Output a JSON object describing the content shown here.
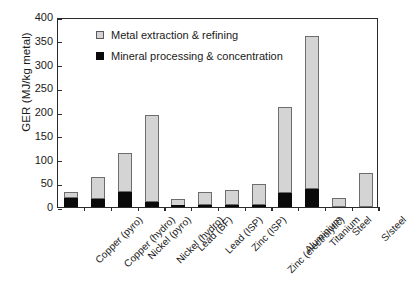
{
  "chart_data": {
    "type": "bar",
    "subtype": "stacked-bar",
    "title": "",
    "xlabel": "",
    "ylabel": "GER (MJ/kg metal)",
    "ylim": [
      0,
      400
    ],
    "ytick_step": 50,
    "yticks": [
      "400",
      "350",
      "300",
      "250",
      "200",
      "150",
      "100",
      "50",
      "0"
    ],
    "grid": false,
    "legend_position": "top-left inside plot",
    "categories": [
      "Copper (pyro)",
      "Copper (hydro)",
      "Nickel (pyro)",
      "Nickel (hydro)",
      "Lead (BF)",
      "Lead (ISP)",
      "Zinc (ISP)",
      "Zinc (electrolytic)",
      "Aluminium",
      "Titanium",
      "Steel",
      "S/steel"
    ],
    "series": [
      {
        "name": "Mineral processing & concentration",
        "color": "#0a0a0a",
        "values": [
          19,
          17,
          31,
          10,
          3,
          4,
          5,
          5,
          29,
          37,
          0,
          0
        ]
      },
      {
        "name": "Metal extraction & refining",
        "color": "#d4d4d4",
        "values": [
          13,
          47,
          83,
          184,
          14,
          28,
          31,
          43,
          182,
          324,
          19,
          71
        ]
      }
    ],
    "totals": [
      32,
      64,
      114,
      194,
      17,
      32,
      36,
      48,
      211,
      361,
      19,
      71
    ]
  },
  "legend": {
    "items": [
      {
        "label": "Metal extraction & refining",
        "swatch": "light"
      },
      {
        "label": "Mineral processing & concentration",
        "swatch": "dark"
      }
    ]
  }
}
